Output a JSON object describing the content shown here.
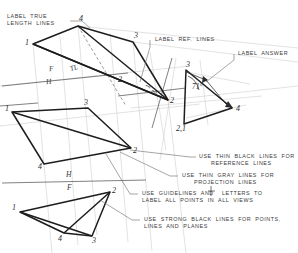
{
  "drawing": {
    "title": "descriptive-geometry-plane-angle-layout",
    "background": "#ffffff",
    "colors": {
      "strong_line": "#1d1d1d",
      "thin_black_line": "#555555",
      "gray_projection_line": "#c3c3c3",
      "hidden_line": "#6b6b6b",
      "text": "#3a3a3a"
    }
  },
  "annotations": [
    {
      "id": "label-true-length-lines",
      "lines": [
        "LABEL  TRUE",
        "LENGTH  LINES"
      ]
    },
    {
      "id": "label-ref-lines",
      "lines": [
        "LABEL  REF.  LINES"
      ]
    },
    {
      "id": "label-answer",
      "lines": [
        "LABEL  ANSWER"
      ]
    },
    {
      "id": "use-thin-black-lines",
      "lines": [
        "USE  THIN  BLACK  LINES  FOR",
        "REFERENCE  LINES"
      ]
    },
    {
      "id": "use-thin-gray-lines",
      "lines": [
        "USE  THIN  GRAY  LINES  FOR",
        "PROJECTION  LINES"
      ]
    },
    {
      "id": "use-guidelines",
      "lines": [
        "USE  GUIDELINES  AND    LETTERS  TO",
        "LABEL  ALL  POINTS  IN  ALL  VIEWS"
      ],
      "fraction": "1/8"
    },
    {
      "id": "use-strong-black-lines",
      "lines": [
        "USE  STRONG  BLACK  LINES  FOR  POINTS,",
        "LINES  AND  PLANES"
      ]
    }
  ],
  "views": {
    "auxiliary_upper": {
      "name": "auxiliary-view-upper",
      "point_labels": [
        "1",
        "4",
        "3",
        "2"
      ],
      "true_length_mark": "TL"
    },
    "horizontal": {
      "name": "horizontal-view",
      "point_labels": [
        "1",
        "3",
        "2",
        "4"
      ]
    },
    "frontal": {
      "name": "frontal-view",
      "point_labels": [
        "1",
        "2",
        "4",
        "3"
      ]
    },
    "answer": {
      "name": "answer-view",
      "point_labels": [
        "3",
        "4",
        "2,1"
      ],
      "angle": "71°"
    },
    "edge_point": {
      "name": "edge-view-point-label",
      "label": "2"
    }
  },
  "reference_lines": [
    {
      "id": "ref-line-fh",
      "top": "F",
      "bottom": "H"
    },
    {
      "id": "ref-line-hf",
      "top": "H",
      "bottom": "F"
    },
    {
      "id": "ref-line-12",
      "top": "1",
      "bottom": "2"
    }
  ]
}
